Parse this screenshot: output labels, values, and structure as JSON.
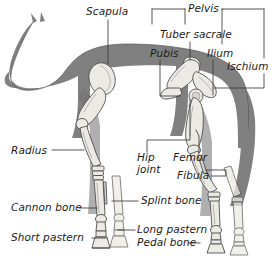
{
  "figure": {
    "view": "left lateral silhouette with skeleton overlay",
    "background_color": "#ffffff",
    "body_color": "#808080",
    "body_outline_color": "#5a5a5a",
    "bone_fill_color": "#e8e6e0",
    "bone_outline_color": "#555555",
    "leader_line_color": "#3a3a3a",
    "label_text_color": "#1a1a1a"
  },
  "labels": [
    {
      "id": "scapula",
      "text": "Scapula",
      "x": 86,
      "y": 6,
      "align": "left"
    },
    {
      "id": "pelvis",
      "text": "Pelvis",
      "x": 188,
      "y": 3,
      "align": "left"
    },
    {
      "id": "tuber-sacrale",
      "text": "Tuber sacrale",
      "x": 160,
      "y": 29,
      "align": "left"
    },
    {
      "id": "pubis",
      "text": "Pubis",
      "x": 150,
      "y": 48,
      "align": "left"
    },
    {
      "id": "ilium",
      "text": "Ilium",
      "x": 207,
      "y": 48,
      "align": "left"
    },
    {
      "id": "ischium",
      "text": "Ischium",
      "x": 229,
      "y": 61,
      "align": "left"
    },
    {
      "id": "radius",
      "text": "Radius",
      "x": 11,
      "y": 145,
      "align": "left"
    },
    {
      "id": "hip-joint",
      "text": "Hip joint",
      "x": 137,
      "y": 155,
      "align": "left"
    },
    {
      "id": "femur",
      "text": "Femur",
      "x": 173,
      "y": 155,
      "align": "left"
    },
    {
      "id": "fibula",
      "text": "Fibula",
      "x": 177,
      "y": 171,
      "align": "left"
    },
    {
      "id": "cannon-bone",
      "text": "Cannon bone",
      "x": 11,
      "y": 203,
      "align": "left"
    },
    {
      "id": "splint-bone",
      "text": "Splint bone",
      "x": 141,
      "y": 196,
      "align": "left"
    },
    {
      "id": "long-pastern",
      "text": "Long pastern",
      "x": 137,
      "y": 225,
      "align": "left"
    },
    {
      "id": "short-pastern",
      "text": "Short pastern",
      "x": 11,
      "y": 233,
      "align": "left"
    },
    {
      "id": "pedal-bone",
      "text": "Pedal bone",
      "x": 137,
      "y": 238,
      "align": "left"
    }
  ],
  "bones_identified": [
    "Scapula",
    "Pelvis",
    "Tuber sacrale",
    "Pubis",
    "Ilium",
    "Ischium",
    "Radius",
    "Hip joint",
    "Femur",
    "Fibula",
    "Cannon bone",
    "Splint bone",
    "Long pastern",
    "Short pastern",
    "Pedal bone"
  ]
}
